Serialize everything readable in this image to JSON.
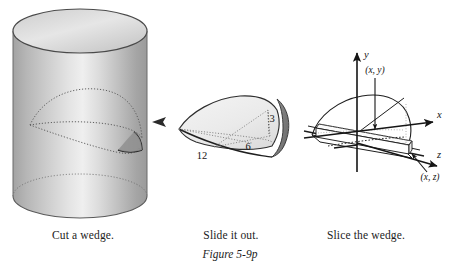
{
  "figure": {
    "number": "Figure 5-9p",
    "captions": [
      {
        "id": "cut",
        "text": "Cut a wedge."
      },
      {
        "id": "slide",
        "text": "Slide it out."
      },
      {
        "id": "slice",
        "text": "Slice the wedge."
      }
    ]
  },
  "panel_cylinder": {
    "name": "Cut a wedge.",
    "shape": "vertical circular cylinder with a wedge cut traced on its surface",
    "colors": {
      "body_light": "#efefef",
      "body_mid": "#c9c9c9",
      "body_dark": "#9a9a9a",
      "top_face": "#d8d8d8",
      "outline": "#4a4a4a",
      "dotted": "#6a6a6a"
    }
  },
  "panel_wedge": {
    "name": "Slide it out.",
    "dimension_labels": [
      {
        "value": "12",
        "meaning": "length of wedge base"
      },
      {
        "value": "6",
        "meaning": "half-width / radius of wedge base"
      },
      {
        "value": "3",
        "meaning": "height of wedge"
      }
    ],
    "colors": {
      "face_light": "#f1f1f1",
      "face_shadow": "#8d8d8d",
      "outline": "#2e2e2e",
      "dotted": "#7a7a7a"
    }
  },
  "panel_slice": {
    "name": "Slice the wedge.",
    "axes": [
      {
        "label": "y",
        "direction": "up"
      },
      {
        "label": "x",
        "direction": "right"
      },
      {
        "label": "z",
        "direction": "front-right"
      }
    ],
    "point_labels": [
      {
        "text": "(x, y)",
        "meaning": "point on the parabolic top edge in the xy-plane"
      },
      {
        "text": "(x, z)",
        "meaning": "point on the circular base edge in the xz-plane"
      }
    ],
    "colors": {
      "outline": "#1e1e1e",
      "hidden": "#8a8a8a",
      "fill": "#ffffff"
    }
  }
}
